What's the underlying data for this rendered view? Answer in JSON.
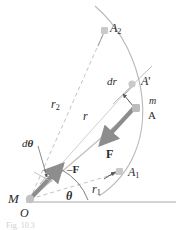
{
  "figure": {
    "type": "physics-orbit-diagram",
    "caption": "Fig. 10.3",
    "colors": {
      "curve": "#b9b9b9",
      "dashed": "#c3c3c3",
      "radius": "#bdbdbd",
      "force_arrow": "#8d8d8d",
      "marker": "#c9c9c9",
      "text": "#2b2b2b",
      "baseline": "#a8a8a8"
    },
    "labels": {
      "center_mass": "M",
      "origin": "O",
      "angle_theta": "θ",
      "angle_dtheta_d": "d",
      "angle_dtheta_sym": "θ",
      "radius_r": "r",
      "radius_r1_base": "r",
      "radius_r1_sub": "1",
      "radius_r2_base": "r",
      "radius_r2_sub": "2",
      "point_A": "A",
      "point_A_prime_base": "A",
      "point_A_prime_mark": "'",
      "point_A1_base": "A",
      "point_A1_sub": "1",
      "point_A2_base": "A",
      "point_A2_sub": "2",
      "particle_mass": "m",
      "dr_d": "d",
      "dr_r": "r",
      "force": "F",
      "reaction_force_sign": "–",
      "reaction_force": "F"
    }
  }
}
